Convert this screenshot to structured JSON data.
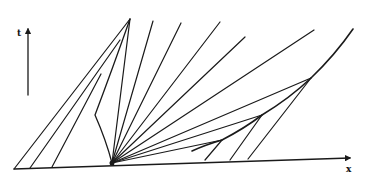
{
  "diagram": {
    "type": "space-time characteristics diagram (rarefaction fan with shock formation)",
    "axes": {
      "t_label": "t",
      "x_label": "x"
    },
    "colors": {
      "line": "#1a1a1a",
      "background": "#ffffff"
    },
    "baseline": {
      "x1": 14,
      "y1": 169,
      "x2": 352,
      "y2": 158
    },
    "t_axis": {
      "x": 28,
      "y_bottom": 95,
      "y_top": 28
    },
    "fan_origin": {
      "x": 112,
      "y": 163
    },
    "left_shock": {
      "path": "M112,163 Q106,140 95,115 Q112,70 130,19"
    },
    "left_characteristics": [
      {
        "x1": 14,
        "y1": 169,
        "x2": 130,
        "y2": 19
      },
      {
        "x1": 30,
        "y1": 168,
        "x2": 120,
        "y2": 40
      },
      {
        "x1": 52,
        "y1": 167,
        "x2": 101,
        "y2": 74
      }
    ],
    "fan_lines": [
      {
        "x2": 130,
        "y2": 19
      },
      {
        "x2": 153,
        "y2": 21
      },
      {
        "x2": 181,
        "y2": 23
      },
      {
        "x2": 220,
        "y2": 22
      },
      {
        "x2": 245,
        "y2": 37
      },
      {
        "x2": 314,
        "y2": 30
      },
      {
        "x2": 311,
        "y2": 78
      },
      {
        "x2": 262,
        "y2": 115
      },
      {
        "x2": 222,
        "y2": 140
      }
    ],
    "right_shock": {
      "path": "M192,151 Q205,145 222,140 Q245,128 262,115 Q290,98 311,78 Q335,55 353,29"
    },
    "right_characteristics": [
      {
        "x1": 205,
        "y1": 160,
        "x2": 222,
        "y2": 140
      },
      {
        "x1": 230,
        "y1": 160,
        "x2": 262,
        "y2": 115
      },
      {
        "x1": 248,
        "y1": 159,
        "x2": 311,
        "y2": 78
      }
    ]
  }
}
